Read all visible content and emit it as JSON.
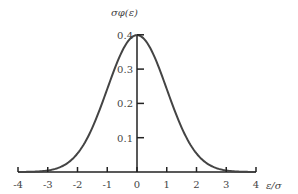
{
  "chart_data": {
    "type": "line",
    "title": "",
    "xlabel": "ε/σ",
    "ylabel": "σφ(ε)",
    "xlim": [
      -4,
      4
    ],
    "ylim": [
      0,
      0.4
    ],
    "grid": false,
    "legend": null,
    "x_ticks": [
      -4,
      -3,
      -2,
      -1,
      0,
      1,
      2,
      3,
      4
    ],
    "x_tick_labels": [
      "-4",
      "-3",
      "-2",
      "-1",
      "0",
      "1",
      "2",
      "3",
      "4"
    ],
    "y_ticks": [
      0.1,
      0.2,
      0.3,
      0.4
    ],
    "y_tick_labels": [
      "0.1",
      "0.2",
      "0.3",
      "0.4"
    ],
    "series": [
      {
        "name": "standard normal density",
        "x": [
          -4,
          -3.5,
          -3,
          -2.5,
          -2,
          -1.5,
          -1,
          -0.5,
          0,
          0.5,
          1,
          1.5,
          2,
          2.5,
          3,
          3.5,
          4
        ],
        "values": [
          0.0001,
          0.0009,
          0.0044,
          0.0175,
          0.054,
          0.1295,
          0.242,
          0.3521,
          0.3989,
          0.3521,
          0.242,
          0.1295,
          0.054,
          0.0175,
          0.0044,
          0.0009,
          0.0001
        ]
      }
    ],
    "colors": {
      "curve": "#444444",
      "axes": "#222222",
      "text": "#444444"
    }
  }
}
